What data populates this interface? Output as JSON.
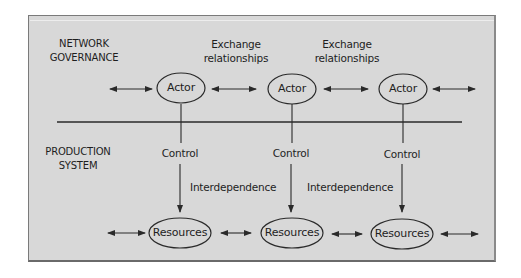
{
  "diagram": {
    "type": "network-governance-production-system",
    "sections": {
      "top": {
        "line1": "NETWORK",
        "line2": "GOVERNANCE"
      },
      "bottom": {
        "line1": "PRODUCTION",
        "line2": "SYSTEM"
      }
    },
    "edge_labels": {
      "exchange_1": {
        "line1": "Exchange",
        "line2": "relationships"
      },
      "exchange_2": {
        "line1": "Exchange",
        "line2": "relationships"
      },
      "control_1": "Control",
      "control_2": "Control",
      "control_3": "Control",
      "interdependence_1": "Interdependence",
      "interdependence_2": "Interdependence"
    },
    "actors": [
      {
        "label": "Actor"
      },
      {
        "label": "Actor"
      },
      {
        "label": "Actor"
      }
    ],
    "resources": [
      {
        "label": "Resources"
      },
      {
        "label": "Resources"
      },
      {
        "label": "Resources"
      }
    ],
    "colors": {
      "background": "#d8d8d8",
      "stroke": "#2a2a2a",
      "text": "#1e1e1e"
    }
  }
}
